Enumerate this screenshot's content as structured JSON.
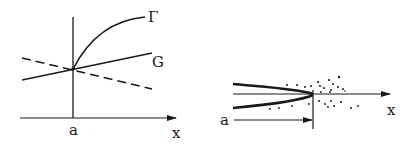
{
  "figure": {
    "left_panel": {
      "axis_label_x": "x",
      "tick_label_a": "a",
      "curve_labels": {
        "gamma": "Γ",
        "g": "G"
      },
      "lines": [
        {
          "name": "Gamma curve",
          "style": "solid",
          "shape": "concave-increasing, starts at x=a"
        },
        {
          "name": "G line",
          "style": "solid",
          "shape": "linear increasing"
        },
        {
          "name": "dashed line",
          "style": "dashed",
          "shape": "linear decreasing"
        }
      ]
    },
    "right_panel": {
      "axis_label_x": "x",
      "arrow_label_a": "a",
      "elements": [
        {
          "name": "upper boundary",
          "style": "thick solid"
        },
        {
          "name": "lower boundary",
          "style": "thick solid"
        },
        {
          "name": "center axis",
          "style": "solid arrow"
        },
        {
          "name": "scattered particles",
          "style": "dots"
        },
        {
          "name": "distance arrow a",
          "style": "solid arrow"
        }
      ]
    },
    "colors": {
      "ink": "#1a1a1a",
      "background": "#ffffff"
    }
  }
}
